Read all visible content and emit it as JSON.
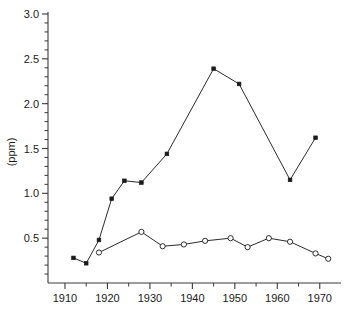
{
  "chart_data": {
    "type": "line",
    "title": "",
    "xlabel": "",
    "ylabel": "(ppm)",
    "xlim": [
      1906,
      1975
    ],
    "ylim": [
      0.0,
      3.0
    ],
    "grid": false,
    "legend": "none",
    "x_ticks": [
      1910,
      1920,
      1930,
      1940,
      1950,
      1960,
      1970
    ],
    "x_tick_labels": [
      "1910",
      "1920",
      "1930",
      "1940",
      "1950",
      "1960",
      "1970"
    ],
    "x_minor_ticks": [
      1915,
      1925,
      1935,
      1945,
      1955,
      1965
    ],
    "y_ticks": [
      0.5,
      1.0,
      1.5,
      2.0,
      2.5,
      3.0
    ],
    "y_tick_labels": [
      "0.5",
      "1.0",
      "1.5",
      "2.0",
      "2.5",
      "3.0"
    ],
    "y_minor_ticks": [
      0.1,
      0.2,
      0.3,
      0.4,
      0.6,
      0.7,
      0.8,
      0.9,
      1.1,
      1.2,
      1.3,
      1.4,
      1.6,
      1.7,
      1.8,
      1.9,
      2.1,
      2.2,
      2.3,
      2.4,
      2.6,
      2.7,
      2.8,
      2.9
    ],
    "series": [
      {
        "name": "upper-series",
        "marker": "filled-square",
        "color": "#1a1a1a",
        "points": [
          {
            "x": 1912,
            "y": 0.28
          },
          {
            "x": 1915,
            "y": 0.22
          },
          {
            "x": 1918,
            "y": 0.48
          },
          {
            "x": 1921,
            "y": 0.94
          },
          {
            "x": 1924,
            "y": 1.14
          },
          {
            "x": 1928,
            "y": 1.12
          },
          {
            "x": 1934,
            "y": 1.44
          },
          {
            "x": 1945,
            "y": 2.39
          },
          {
            "x": 1951,
            "y": 2.22
          },
          {
            "x": 1963,
            "y": 1.15
          },
          {
            "x": 1969,
            "y": 1.62
          }
        ]
      },
      {
        "name": "lower-series",
        "marker": "open-circle",
        "color": "#1a1a1a",
        "points": [
          {
            "x": 1918,
            "y": 0.34
          },
          {
            "x": 1928,
            "y": 0.57
          },
          {
            "x": 1933,
            "y": 0.41
          },
          {
            "x": 1938,
            "y": 0.43
          },
          {
            "x": 1943,
            "y": 0.47
          },
          {
            "x": 1949,
            "y": 0.5
          },
          {
            "x": 1953,
            "y": 0.4
          },
          {
            "x": 1958,
            "y": 0.5
          },
          {
            "x": 1963,
            "y": 0.46
          },
          {
            "x": 1969,
            "y": 0.33
          },
          {
            "x": 1972,
            "y": 0.27
          }
        ]
      }
    ]
  }
}
